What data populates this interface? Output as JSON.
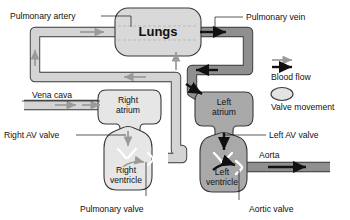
{
  "diagram": {
    "organs": {
      "lungs": {
        "label": "Lungs",
        "fill": "#d9d9d9"
      },
      "right_atrium": {
        "label_line1": "Right",
        "label_line2": "atrium",
        "fill": "#e6e6e6"
      },
      "right_ventricle": {
        "label_line1": "Right",
        "label_line2": "ventricle",
        "fill": "#e6e6e6"
      },
      "left_atrium": {
        "label_line1": "Left",
        "label_line2": "atrium",
        "fill": "#a9a9a9"
      },
      "left_ventricle": {
        "label_line1": "Left",
        "label_line2": "ventricle",
        "fill": "#a9a9a9"
      }
    },
    "vessels": {
      "pulmonary_artery": {
        "label": "Pulmonary artery",
        "fill": "#d4d4d4",
        "flow": "deoxygenated"
      },
      "pulmonary_vein": {
        "label": "Pulmonary vein",
        "fill": "#8f8f8f",
        "flow": "oxygenated"
      },
      "vena_cava": {
        "label": "Vena cava",
        "fill": "#d4d4d4",
        "flow": "deoxygenated"
      },
      "aorta": {
        "label": "Aorta",
        "fill": "#8f8f8f",
        "flow": "oxygenated"
      }
    },
    "valves": {
      "right_av_valve": {
        "label": "Right AV valve"
      },
      "pulmonary_valve": {
        "label": "Pulmonary valve"
      },
      "left_av_valve": {
        "label": "Left AV valve"
      },
      "aortic_valve": {
        "label": "Aortic valve"
      }
    },
    "legend": {
      "items": [
        {
          "label": "Blood flow",
          "symbol": "double-arrow-icon"
        },
        {
          "label": "Valve movement",
          "symbol": "valve-oval-icon"
        }
      ]
    },
    "colors": {
      "deoxygenated_vessel": "#d4d4d4",
      "oxygenated_vessel": "#8f8f8f",
      "outline": "#3a3a3a",
      "arrow_dark": "#111111",
      "arrow_light": "#9a9a9a",
      "text": "#111111",
      "background": "#ffffff"
    }
  }
}
